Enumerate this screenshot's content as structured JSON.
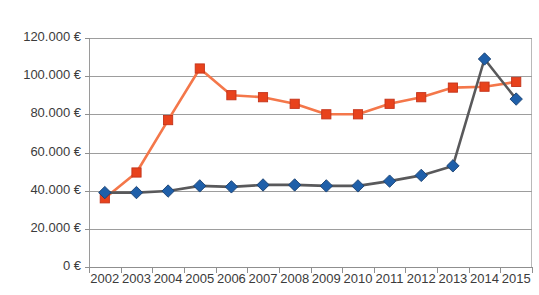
{
  "chart_data": {
    "type": "line",
    "title": "VW T1 Samba Pritsche 520 GTB",
    "xlabel": "",
    "ylabel": "",
    "categories": [
      "2002",
      "2003",
      "2004",
      "2005",
      "2006",
      "2007",
      "2008",
      "2009",
      "2010",
      "2011",
      "2012",
      "2013",
      "2014",
      "2015"
    ],
    "ylim": [
      0,
      120000
    ],
    "ytick_values": [
      0,
      20000,
      40000,
      60000,
      80000,
      100000,
      120000
    ],
    "ytick_labels": [
      "0 €",
      "20.000 €",
      "40.000 €",
      "60.000 €",
      "80.000 €",
      "100.000 €",
      "120.000 €"
    ],
    "grid": true,
    "legend": "none",
    "series": [
      {
        "name": "series-orange",
        "color": "#ED5A23",
        "line_color": "#F4774A",
        "marker": "square",
        "marker_color": "#E8421C",
        "values": [
          36000,
          49500,
          77000,
          104000,
          90000,
          89000,
          85500,
          80000,
          80000,
          85500,
          89000,
          94000,
          94500,
          97000
        ]
      },
      {
        "name": "series-blue",
        "color": "#2E5F9E",
        "line_color": "#59595B",
        "marker": "diamond",
        "marker_color": "#1F5FA9",
        "values": [
          39000,
          39000,
          39800,
          42500,
          42000,
          43000,
          43000,
          42500,
          42500,
          45000,
          48000,
          53000,
          109000,
          88000
        ]
      }
    ]
  },
  "colors": {
    "accent_orange": "#E8451B",
    "accent_blue": "#1F5FA9",
    "grid": "#9d9d9d",
    "axis": "#8f8f8f",
    "text": "#3b3b3b"
  }
}
